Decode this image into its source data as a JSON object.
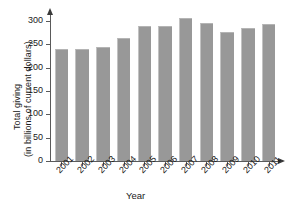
{
  "chart_data": {
    "type": "bar",
    "title": "",
    "xlabel": "Year",
    "ylabel": "Total giving\n(in billions of current dollars)",
    "ylabel_line1": "Total giving",
    "ylabel_line2": "(in billions of current dollars)",
    "categories": [
      "2001",
      "2002",
      "2003",
      "2004",
      "2005",
      "2006",
      "2007",
      "2008",
      "2009",
      "2010",
      "2011"
    ],
    "values": [
      240,
      240,
      245,
      263,
      290,
      290,
      306,
      295,
      276,
      284,
      293
    ],
    "ylim": [
      0,
      315
    ],
    "yticks": [
      0,
      50,
      100,
      150,
      200,
      250,
      300
    ],
    "ytick_labels": [
      "0",
      "50",
      "100",
      "150",
      "200",
      "250",
      "300"
    ],
    "grid": false,
    "legend": false,
    "bar_color": "#989898",
    "axis_color": "#5a5a5a",
    "text_color": "#1a1a1a"
  }
}
